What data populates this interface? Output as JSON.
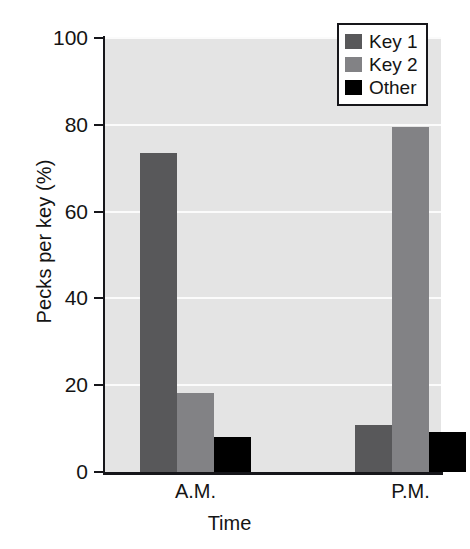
{
  "chart_data": {
    "type": "bar",
    "title": "",
    "xlabel": "Time",
    "ylabel": "Pecks per key (%)",
    "categories": [
      "A.M.",
      "P.M."
    ],
    "series": [
      {
        "name": "Key 1",
        "values": [
          73.5,
          10.8
        ],
        "color": "#58585a"
      },
      {
        "name": "Key 2",
        "values": [
          18.3,
          79.5
        ],
        "color": "#828285"
      },
      {
        "name": "Other",
        "values": [
          8.0,
          9.2
        ],
        "color": "#000000"
      }
    ],
    "ylim": [
      0,
      100
    ],
    "yticks": [
      0,
      20,
      40,
      60,
      80,
      100
    ],
    "ytick_labels": [
      "0",
      "20",
      "40",
      "60",
      "80",
      "100"
    ],
    "grid": true,
    "grid_color": "#fbfbfb",
    "plot_background": "#e4e4e4",
    "figure_background": "#ffffff",
    "legend_position": "top-right",
    "legend_entries": [
      "Key 1",
      "Key 2",
      "Other"
    ]
  },
  "axis": {
    "y_title": "Pecks per key (%)",
    "x_title": "Time"
  },
  "legend": {
    "items": [
      {
        "label": "Key 1",
        "color": "#58585a"
      },
      {
        "label": "Key 2",
        "color": "#828285"
      },
      {
        "label": "Other",
        "color": "#000000"
      }
    ]
  }
}
